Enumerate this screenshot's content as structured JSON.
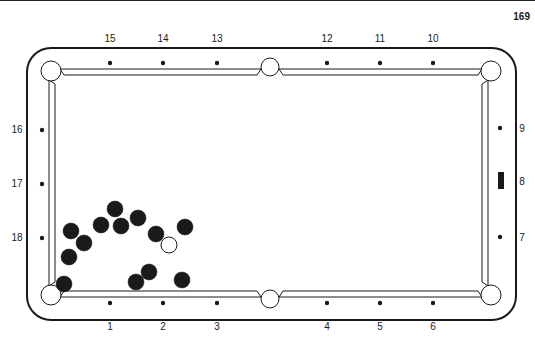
{
  "page": {
    "number": "169"
  },
  "table": {
    "outer": {
      "x": 27,
      "y": 48,
      "w": 489,
      "h": 272,
      "r": 24
    },
    "rail_top": {
      "outer_y": 69,
      "inner_y": 75
    },
    "rail_bottom": {
      "outer_y": 297,
      "inner_y": 291
    },
    "rail_left": {
      "outer_x": 49,
      "inner_x": 55
    },
    "rail_right": {
      "outer_x": 488,
      "inner_x": 482
    },
    "pockets": [
      {
        "name": "top-left",
        "cx": 51,
        "cy": 71,
        "r": 10
      },
      {
        "name": "top-middle",
        "cx": 270,
        "cy": 67,
        "r": 9
      },
      {
        "name": "top-right",
        "cx": 491,
        "cy": 71,
        "r": 10
      },
      {
        "name": "bottom-left",
        "cx": 51,
        "cy": 295,
        "r": 10
      },
      {
        "name": "bottom-middle",
        "cx": 270,
        "cy": 299,
        "r": 9
      },
      {
        "name": "bottom-right",
        "cx": 491,
        "cy": 295,
        "r": 10
      }
    ]
  },
  "diamonds": [
    {
      "label": "1",
      "x": 110,
      "y": 303,
      "lx": 110,
      "ly": 330
    },
    {
      "label": "2",
      "x": 163,
      "y": 303,
      "lx": 163,
      "ly": 330
    },
    {
      "label": "3",
      "x": 217,
      "y": 303,
      "lx": 217,
      "ly": 330
    },
    {
      "label": "4",
      "x": 327,
      "y": 303,
      "lx": 327,
      "ly": 330
    },
    {
      "label": "5",
      "x": 380,
      "y": 303,
      "lx": 380,
      "ly": 330
    },
    {
      "label": "6",
      "x": 433,
      "y": 303,
      "lx": 433,
      "ly": 330
    },
    {
      "label": "7",
      "x": 500,
      "y": 237,
      "lx": 522,
      "ly": 241
    },
    {
      "label": "8",
      "x": 501,
      "y": 181,
      "lx": 522,
      "ly": 185,
      "shape": "rect"
    },
    {
      "label": "9",
      "x": 500,
      "y": 128,
      "lx": 522,
      "ly": 132
    },
    {
      "label": "10",
      "x": 433,
      "y": 63,
      "lx": 433,
      "ly": 42
    },
    {
      "label": "11",
      "x": 380,
      "y": 63,
      "lx": 380,
      "ly": 42
    },
    {
      "label": "12",
      "x": 327,
      "y": 63,
      "lx": 327,
      "ly": 42
    },
    {
      "label": "13",
      "x": 217,
      "y": 63,
      "lx": 217,
      "ly": 42
    },
    {
      "label": "14",
      "x": 163,
      "y": 63,
      "lx": 163,
      "ly": 42
    },
    {
      "label": "15",
      "x": 110,
      "y": 63,
      "lx": 110,
      "ly": 42
    },
    {
      "label": "16",
      "x": 42,
      "y": 130,
      "lx": 17,
      "ly": 133
    },
    {
      "label": "17",
      "x": 42,
      "y": 184,
      "lx": 17,
      "ly": 187
    },
    {
      "label": "18",
      "x": 42,
      "y": 238,
      "lx": 17,
      "ly": 241
    }
  ],
  "balls": [
    {
      "type": "object",
      "cx": 71,
      "cy": 231
    },
    {
      "type": "object",
      "cx": 84,
      "cy": 243
    },
    {
      "type": "object",
      "cx": 69,
      "cy": 257
    },
    {
      "type": "object",
      "cx": 101,
      "cy": 225
    },
    {
      "type": "object",
      "cx": 115,
      "cy": 209
    },
    {
      "type": "object",
      "cx": 121,
      "cy": 226
    },
    {
      "type": "object",
      "cx": 138,
      "cy": 218
    },
    {
      "type": "object",
      "cx": 156,
      "cy": 234
    },
    {
      "type": "cue",
      "cx": 169,
      "cy": 245
    },
    {
      "type": "object",
      "cx": 185,
      "cy": 227
    },
    {
      "type": "object",
      "cx": 149,
      "cy": 272
    },
    {
      "type": "object",
      "cx": 136,
      "cy": 282
    },
    {
      "type": "object",
      "cx": 182,
      "cy": 280
    },
    {
      "type": "object",
      "cx": 64,
      "cy": 284
    }
  ],
  "ball_radius": 8,
  "colors": {
    "ink": "#1a1a1a",
    "paper": "#ffffff"
  }
}
